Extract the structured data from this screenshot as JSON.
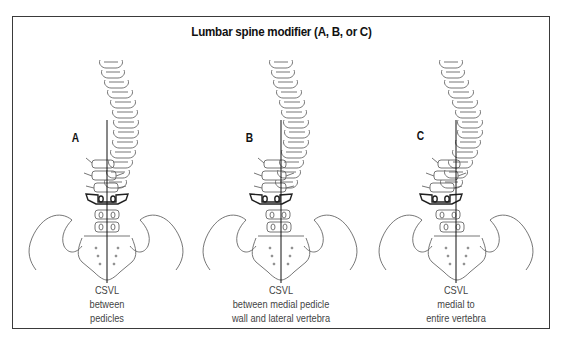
{
  "figure": {
    "title": "Lumbar spine modifier (A, B, or C)",
    "panels": [
      {
        "letter": "A",
        "caption": [
          "CSVL",
          "between",
          "pedicles"
        ],
        "csvl_x": 87,
        "lumbar_shift": 0
      },
      {
        "letter": "B",
        "caption": [
          "CSVL",
          "between medial pedicle",
          "wall and lateral vertebra"
        ],
        "csvl_x": 91,
        "lumbar_shift": -4
      },
      {
        "letter": "C",
        "caption": [
          "CSVL",
          "medial to",
          "entire vertebra"
        ],
        "csvl_x": 86,
        "lumbar_shift": -12
      }
    ],
    "colors": {
      "line": "#555555",
      "bold_line": "#222222",
      "csvl": "#111111",
      "frame": "#3a3a3a"
    }
  }
}
